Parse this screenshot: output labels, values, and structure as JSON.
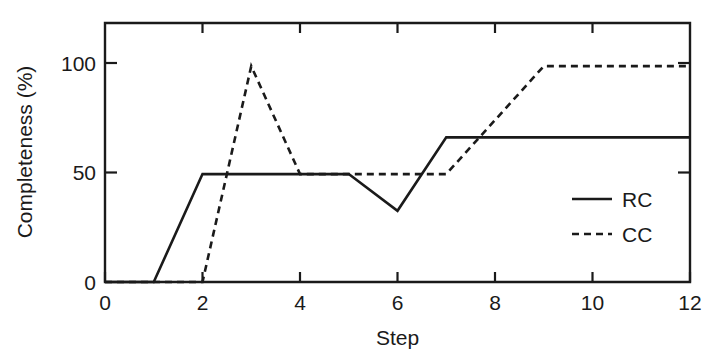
{
  "chart_data": {
    "type": "line",
    "title": "",
    "xlabel": "Step",
    "ylabel": "Completeness (%)",
    "xlim": [
      0,
      12
    ],
    "ylim": [
      0,
      120
    ],
    "grid": false,
    "legend_position": "bottom-right",
    "xticks": [
      0,
      2,
      4,
      6,
      8,
      10,
      12
    ],
    "xtick_labels": [
      "0",
      "2",
      "4",
      "6",
      "8",
      "10",
      "12"
    ],
    "yticks": [
      0,
      50,
      100
    ],
    "ytick_labels": [
      "0",
      "50",
      "100"
    ],
    "x": [
      0,
      1,
      2,
      3,
      4,
      5,
      6,
      7,
      8,
      9,
      10,
      11,
      12
    ],
    "series": [
      {
        "name": "RC",
        "style": "solid",
        "color": "#1a1a1a",
        "values": [
          0,
          0,
          50,
          50,
          50,
          50,
          33,
          67,
          67,
          67,
          67,
          67,
          67
        ]
      },
      {
        "name": "CC",
        "style": "dashed",
        "color": "#1a1a1a",
        "values": [
          0,
          0,
          0,
          100,
          50,
          50,
          50,
          50,
          75,
          100,
          100,
          100,
          100
        ]
      }
    ]
  },
  "axes": {
    "y_title": "Completeness (%)",
    "x_title": "Step",
    "x_tick_labels": [
      "0",
      "2",
      "4",
      "6",
      "8",
      "10",
      "12"
    ],
    "y_tick_labels": [
      "0",
      "50",
      "100"
    ]
  },
  "legend": {
    "entries": [
      {
        "label": "RC",
        "style": "solid"
      },
      {
        "label": "CC",
        "style": "dashed"
      }
    ]
  }
}
